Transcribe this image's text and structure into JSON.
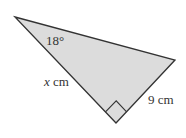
{
  "diagram": {
    "type": "right-triangle",
    "vertices": {
      "top_left": [
        15,
        17
      ],
      "right": [
        175,
        60
      ],
      "bottom": [
        116,
        123
      ]
    },
    "right_angle_at": "bottom",
    "fill_color": "#dcdcdc",
    "stroke_color": "#333333",
    "labels": {
      "angle": "18°",
      "hypotenuse_side": "x",
      "hypotenuse_unit": " cm",
      "short_side": "9 cm"
    }
  }
}
